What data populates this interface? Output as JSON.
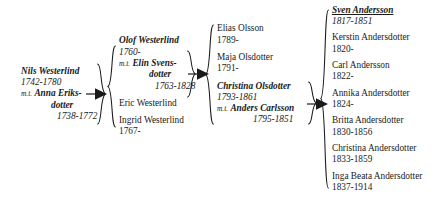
{
  "chart": {
    "type": "genealogy-descendancy-chart",
    "title": "",
    "spouse_prefix": "m.t.",
    "generations": [
      {
        "id": "generation-1",
        "people": [
          {
            "role": "primary",
            "name": "Nils Westerlind",
            "dates": "1742-1780",
            "spouse_prefix": "m.t.",
            "spouse_name_line1": "Anna Eriks-",
            "spouse_name_line2": "dotter",
            "spouse_dates": "1738-1772"
          }
        ]
      },
      {
        "id": "generation-2",
        "people": [
          {
            "role": "primary",
            "name": "Olof Westerlind",
            "dates": "1760-",
            "spouse_prefix": "m.t.",
            "spouse_name_line1": "Elin Svens-",
            "spouse_name_line2": "dotter",
            "spouse_dates": "1763-1828"
          },
          {
            "role": "sibling",
            "name": "Eric Westerlind",
            "dates": ""
          },
          {
            "role": "sibling",
            "name": "Ingrid Westerlind",
            "dates": "1767-"
          }
        ]
      },
      {
        "id": "generation-3",
        "people": [
          {
            "role": "sibling",
            "name": "Elias Olsson",
            "dates": "1789-"
          },
          {
            "role": "sibling",
            "name": "Maja Olsdotter",
            "dates": "1791-"
          },
          {
            "role": "primary",
            "name": "Christina Olsdotter",
            "dates": "1793-1861",
            "spouse_prefix": "m.t.",
            "spouse_name_line1": "Anders Carlsson",
            "spouse_name_line2": "",
            "spouse_dates": "1795-1851"
          }
        ]
      },
      {
        "id": "generation-4",
        "people": [
          {
            "role": "focus",
            "name": "Sven Andersson",
            "dates": "1817-1851"
          },
          {
            "role": "sibling",
            "name": "Kerstin Andersdotter",
            "dates": "1820-"
          },
          {
            "role": "sibling",
            "name": "Carl Andersson",
            "dates": "1822-"
          },
          {
            "role": "sibling",
            "name": "Annika Andersdotter",
            "dates": "1824-"
          },
          {
            "role": "sibling",
            "name": "Britta Andersdotter",
            "dates": "1830-1856"
          },
          {
            "role": "sibling",
            "name": "Christina Andersdotter",
            "dates": "1833-1859"
          },
          {
            "role": "sibling",
            "name": "Inga Beata Andersdotter",
            "dates": "1837-1914"
          }
        ]
      }
    ]
  }
}
